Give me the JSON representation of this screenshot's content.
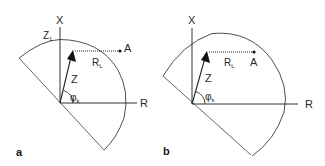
{
  "figure": {
    "panels": [
      {
        "id": "a",
        "panel_label": "a",
        "axis_vertical_label": "X",
        "axis_horizontal_label": "R",
        "vector_label": "Z",
        "angle_label": "φ",
        "angle_subscript": "k",
        "point_label": "A",
        "distance_label": "R",
        "distance_subscript": "L",
        "top_intercept_label": "Z",
        "top_intercept_subscript": "1"
      },
      {
        "id": "b",
        "panel_label": "b",
        "axis_vertical_label": "X",
        "axis_horizontal_label": "R",
        "vector_label": "Z",
        "angle_label": "φ",
        "angle_subscript": "k",
        "point_label": "A",
        "distance_label": "R",
        "distance_subscript": "L"
      }
    ],
    "colors": {
      "line": "#3a3a3a",
      "arc": "#505050",
      "text": "#2a2a2a",
      "background": "#ffffff"
    }
  }
}
